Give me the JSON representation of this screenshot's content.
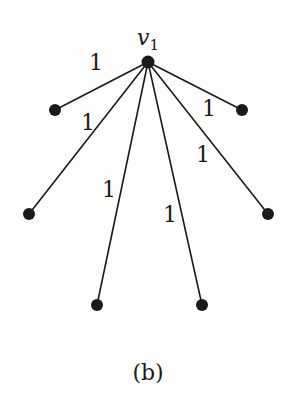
{
  "figure": {
    "caption": "(b)",
    "center_node": {
      "id": "v1",
      "label_main": "v",
      "label_sub": "1",
      "x": 148,
      "y": 62
    },
    "leaves": [
      {
        "id": "leaf-top-left",
        "x": 55,
        "y": 110
      },
      {
        "id": "leaf-mid-left",
        "x": 29,
        "y": 214
      },
      {
        "id": "leaf-bottom-left",
        "x": 97,
        "y": 305
      },
      {
        "id": "leaf-bottom-right",
        "x": 202,
        "y": 305
      },
      {
        "id": "leaf-mid-right",
        "x": 268,
        "y": 214
      },
      {
        "id": "leaf-top-right",
        "x": 242,
        "y": 110
      }
    ],
    "edge_weights": [
      {
        "text": "1",
        "x": 96,
        "y": 70
      },
      {
        "text": "1",
        "x": 88,
        "y": 130
      },
      {
        "text": "1",
        "x": 109,
        "y": 197
      },
      {
        "text": "1",
        "x": 170,
        "y": 222
      },
      {
        "text": "1",
        "x": 203,
        "y": 162
      },
      {
        "text": "1",
        "x": 209,
        "y": 116
      }
    ],
    "colors": {
      "ink": "#1a1a1a",
      "background": "#fdfdfb"
    }
  }
}
